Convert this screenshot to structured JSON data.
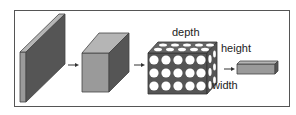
{
  "diagram": {
    "labels": {
      "depth": "depth",
      "height": "height",
      "width": "width"
    },
    "stages": [
      {
        "name": "input-volume-slab"
      },
      {
        "name": "conv-volume-cube"
      },
      {
        "name": "neuron-grid-volume",
        "rows": 3,
        "cols": 5
      },
      {
        "name": "output-bar"
      }
    ],
    "colors": {
      "front_dark": "#555555",
      "side_light": "#9a9a9a",
      "top_mid": "#b5b5b5",
      "border": "#555555"
    }
  }
}
